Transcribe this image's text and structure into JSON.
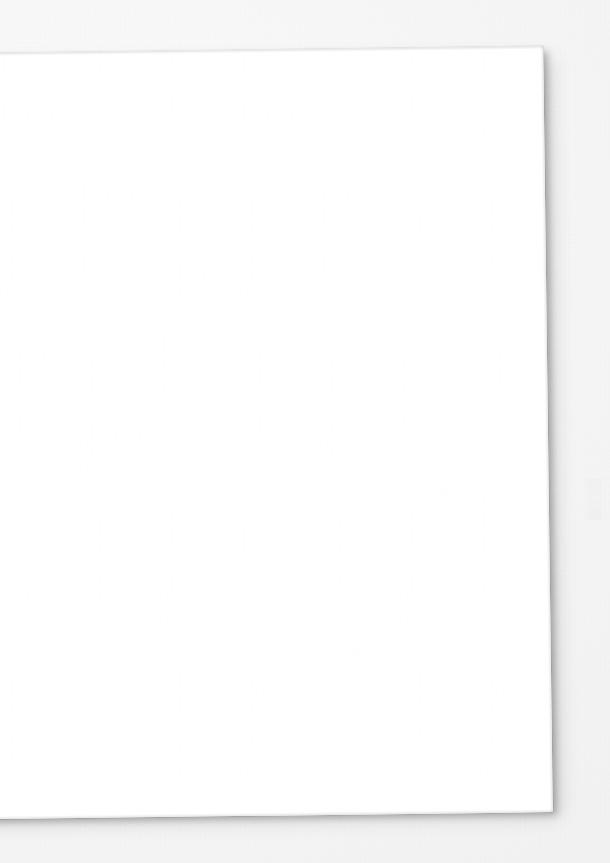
{
  "document": {
    "page_surface": "blank",
    "page_side": "verso",
    "visible_text": "",
    "colors": {
      "backdrop": "#f6f6f6",
      "paper": "#ffffff",
      "shadow": "rgba(0,0,0,0.26)",
      "ghost_ink": "#000000"
    }
  },
  "showthrough": {
    "description": "faint mirrored bleed-through of type printed on the opposite face of the sheet; no characters are legible",
    "header": "······  ········  ····",
    "subheader": "·········  ······",
    "body_upper": [
      "···· ······· ····· ········· ····· ········",
      "········ ···· ·········· ······ ····· ····",
      "····· ·········· ······ ···· ········",
      "·········· ····· ······· ··········· ···"
    ],
    "body_mid": [
      "······· ··········· ····· ········"
    ],
    "body_lower": [
      "·· ····· ······ ········ ····· ····",
      "········ ···· ··········· ······ ···",
      "···· ········· ············ ·····"
    ],
    "footer": [
      "······ ········· ·····"
    ]
  }
}
